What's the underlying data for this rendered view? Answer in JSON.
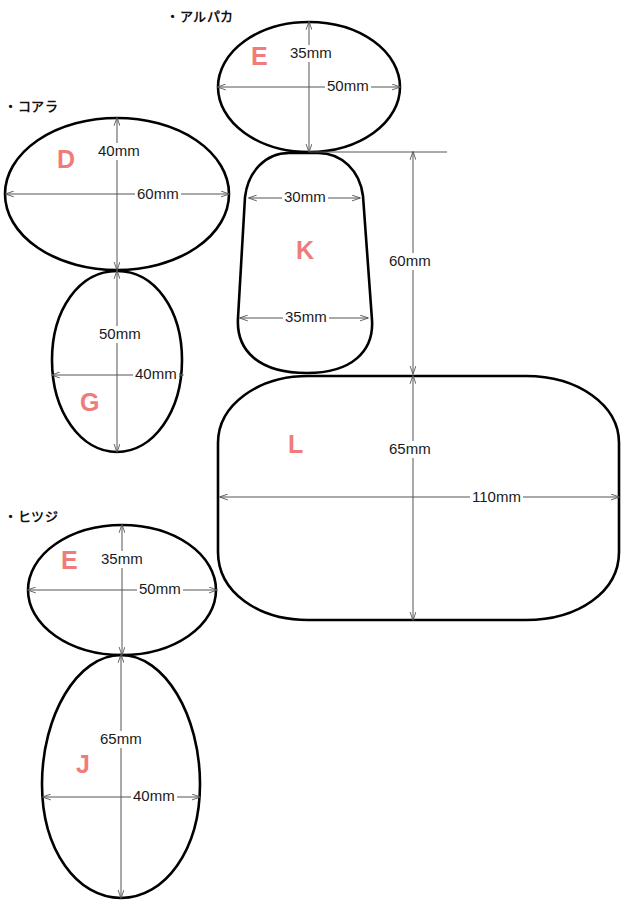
{
  "page": {
    "width": 642,
    "height": 904,
    "background_color": "#ffffff",
    "outline_color": "#000000",
    "letter_color": "#ef7b7b",
    "dimension_color": "#555555"
  },
  "groups": [
    {
      "id": "alpaca",
      "label": "・アルパカ"
    },
    {
      "id": "koala",
      "label": "・コアラ"
    },
    {
      "id": "sheep",
      "label": "・ヒツジ"
    }
  ],
  "shapes": [
    {
      "id": "alpaca-head-e",
      "letter": "E",
      "group": "alpaca",
      "form": "ellipse",
      "width_label": "50mm",
      "height_label": "35mm"
    },
    {
      "id": "alpaca-body-k",
      "letter": "K",
      "group": "alpaca",
      "form": "tapered-rounded",
      "top_width_label": "30mm",
      "bottom_width_label": "35mm",
      "height_label": "60mm"
    },
    {
      "id": "alpaca-base-l",
      "letter": "L",
      "group": "alpaca",
      "form": "stadium",
      "width_label": "110mm",
      "height_label": "65mm"
    },
    {
      "id": "koala-head-d",
      "letter": "D",
      "group": "koala",
      "form": "ellipse",
      "width_label": "60mm",
      "height_label": "40mm"
    },
    {
      "id": "koala-body-g",
      "letter": "G",
      "group": "koala",
      "form": "egg",
      "width_label": "40mm",
      "height_label": "50mm"
    },
    {
      "id": "sheep-head-e",
      "letter": "E",
      "group": "sheep",
      "form": "ellipse",
      "width_label": "50mm",
      "height_label": "35mm"
    },
    {
      "id": "sheep-body-j",
      "letter": "J",
      "group": "sheep",
      "form": "egg",
      "width_label": "40mm",
      "height_label": "65mm"
    }
  ],
  "labels": {
    "alpaca_group": "・アルパカ",
    "koala_group": "・コアラ",
    "sheep_group": "・ヒツジ",
    "letter_alpaca_e": "E",
    "letter_alpaca_k": "K",
    "letter_alpaca_l": "L",
    "letter_koala_d": "D",
    "letter_koala_g": "G",
    "letter_sheep_e": "E",
    "letter_sheep_j": "J",
    "dim_alpaca_e_h": "35mm",
    "dim_alpaca_e_w": "50mm",
    "dim_alpaca_k_top": "30mm",
    "dim_alpaca_k_bottom": "35mm",
    "dim_alpaca_k_h": "60mm",
    "dim_alpaca_l_h": "65mm",
    "dim_alpaca_l_w": "110mm",
    "dim_koala_d_h": "40mm",
    "dim_koala_d_w": "60mm",
    "dim_koala_g_h": "50mm",
    "dim_koala_g_w": "40mm",
    "dim_sheep_e_h": "35mm",
    "dim_sheep_e_w": "50mm",
    "dim_sheep_j_h": "65mm",
    "dim_sheep_j_w": "40mm"
  }
}
